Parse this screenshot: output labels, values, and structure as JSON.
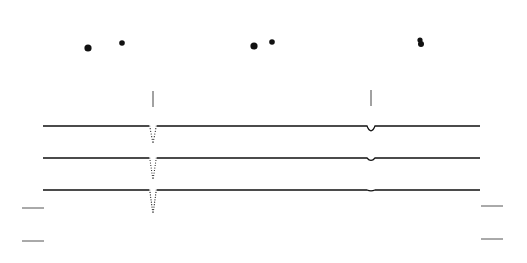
{
  "figure": {
    "background": "#ffffff",
    "ink_color": "#111111",
    "dot_pairs": [
      {
        "dots": [
          {
            "x": 88,
            "y": 48,
            "r": 3.6
          },
          {
            "x": 122,
            "y": 43,
            "r": 2.8
          }
        ]
      },
      {
        "dots": [
          {
            "x": 254,
            "y": 46,
            "r": 3.6
          },
          {
            "x": 272,
            "y": 42,
            "r": 2.8
          }
        ]
      },
      {
        "dots": [
          {
            "x": 420,
            "y": 40,
            "r": 2.6
          },
          {
            "x": 421,
            "y": 44,
            "r": 3.0
          }
        ]
      }
    ],
    "event_markers": [
      {
        "x": 153,
        "y1": 91,
        "y2": 107
      },
      {
        "x": 371,
        "y1": 90,
        "y2": 106
      }
    ],
    "traces": [
      {
        "baseline_y": 126,
        "x_start": 43,
        "x_end": 480,
        "events": [
          {
            "x": 153,
            "depth": 16,
            "style": "dotted"
          },
          {
            "x": 371,
            "depth": 6,
            "style": "solid"
          }
        ]
      },
      {
        "baseline_y": 158,
        "x_start": 43,
        "x_end": 480,
        "events": [
          {
            "x": 153,
            "depth": 20,
            "style": "dotted"
          },
          {
            "x": 371,
            "depth": 3,
            "style": "solid"
          }
        ]
      },
      {
        "baseline_y": 190,
        "x_start": 43,
        "x_end": 480,
        "events": [
          {
            "x": 153,
            "depth": 22,
            "style": "dotted"
          },
          {
            "x": 371,
            "depth": 1,
            "style": "solid"
          }
        ]
      }
    ],
    "scale_bars_left": [
      {
        "x1": 22,
        "x2": 44,
        "y": 208
      },
      {
        "x1": 22,
        "x2": 44,
        "y": 241
      }
    ],
    "scale_bars_right": [
      {
        "x1": 481,
        "x2": 503,
        "y": 206
      },
      {
        "x1": 481,
        "x2": 503,
        "y": 239
      }
    ]
  }
}
